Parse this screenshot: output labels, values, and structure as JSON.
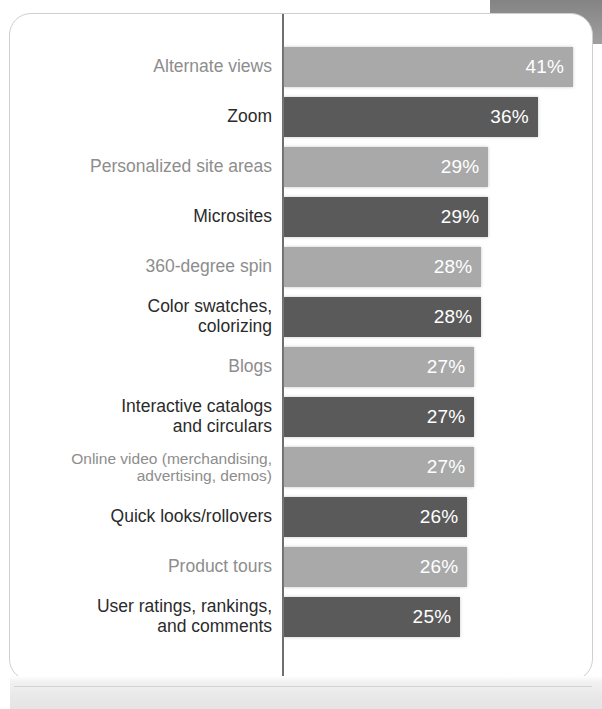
{
  "chart_data": {
    "type": "bar",
    "orientation": "horizontal",
    "title": "",
    "subtitle": "",
    "xlabel": "",
    "ylabel": "",
    "xlim": [
      0,
      41
    ],
    "grid": false,
    "legend": false,
    "value_suffix": "%",
    "categories": [
      "Alternate views",
      "Zoom",
      "Personalized site areas",
      "Microsites",
      "360-degree spin",
      "Color swatches, colorizing",
      "Blogs",
      "Interactive catalogs and circulars",
      "Online video (merchandising, advertising, demos)",
      "Quick looks/rollovers",
      "Product tours",
      "User ratings, rankings, and comments"
    ],
    "values": [
      41,
      36,
      29,
      29,
      28,
      28,
      27,
      27,
      27,
      26,
      26,
      25
    ],
    "value_labels": [
      "41%",
      "36%",
      "29%",
      "29%",
      "28%",
      "28%",
      "27%",
      "27%",
      "27%",
      "26%",
      "26%",
      "25%"
    ]
  },
  "rows": [
    {
      "label_lines": [
        "Alternate views"
      ],
      "value_label": "41%",
      "value": 41,
      "tone": "light",
      "small": false
    },
    {
      "label_lines": [
        "Zoom"
      ],
      "value_label": "36%",
      "value": 36,
      "tone": "dark",
      "small": false
    },
    {
      "label_lines": [
        "Personalized site areas"
      ],
      "value_label": "29%",
      "value": 29,
      "tone": "light",
      "small": false
    },
    {
      "label_lines": [
        "Microsites"
      ],
      "value_label": "29%",
      "value": 29,
      "tone": "dark",
      "small": false
    },
    {
      "label_lines": [
        "360-degree spin"
      ],
      "value_label": "28%",
      "value": 28,
      "tone": "light",
      "small": false
    },
    {
      "label_lines": [
        "Color swatches,",
        "colorizing"
      ],
      "value_label": "28%",
      "value": 28,
      "tone": "dark",
      "small": false
    },
    {
      "label_lines": [
        "Blogs"
      ],
      "value_label": "27%",
      "value": 27,
      "tone": "light",
      "small": false
    },
    {
      "label_lines": [
        "Interactive catalogs",
        "and circulars"
      ],
      "value_label": "27%",
      "value": 27,
      "tone": "dark",
      "small": false
    },
    {
      "label_lines": [
        "Online video (merchandising,",
        "advertising, demos)"
      ],
      "value_label": "27%",
      "value": 27,
      "tone": "light",
      "small": true
    },
    {
      "label_lines": [
        "Quick looks/rollovers"
      ],
      "value_label": "26%",
      "value": 26,
      "tone": "dark",
      "small": false
    },
    {
      "label_lines": [
        "Product tours"
      ],
      "value_label": "26%",
      "value": 26,
      "tone": "light",
      "small": false
    },
    {
      "label_lines": [
        "User ratings, rankings,",
        "and comments"
      ],
      "value_label": "25%",
      "value": 25,
      "tone": "dark",
      "small": false
    }
  ],
  "style": {
    "bar_light_color": "#a9a9a9",
    "bar_dark_color": "#5a5a5a",
    "label_light_color": "#8d8d8d",
    "label_dark_color": "#2b2b2b",
    "value_text_color": "#ffffff",
    "axis_color": "#6f6f6f",
    "card_border_color": "#cfcfcf",
    "background_color": "#ffffff",
    "px_per_unit": 7.05
  }
}
